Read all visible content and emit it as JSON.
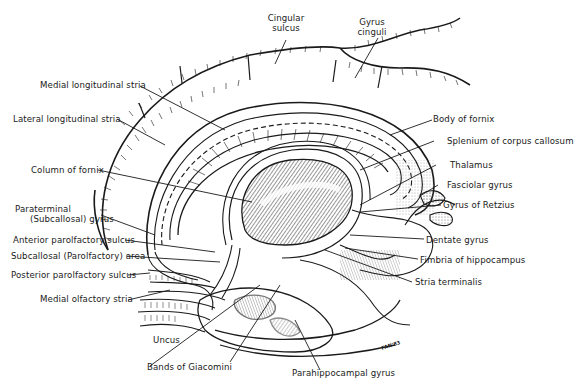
{
  "figure": {
    "signature": "FAN'83",
    "colors": {
      "ink": "#1a1a1a",
      "background": "#ffffff",
      "stipple": "#9a9a9a"
    }
  },
  "labels": {
    "cingular_sulcus": {
      "line1": "Cingular",
      "line2": "sulcus"
    },
    "gyrus_cinguli": {
      "line1": "Gyrus",
      "line2": "cinguli"
    },
    "medial_longitudinal_stria": "Medial longitudinal stria",
    "lateral_longitudinal_stria": "Lateral longitudinal stria",
    "column_of_fornix": "Column of fornix",
    "paraterminal_gyrus": {
      "line1": "Paraterminal",
      "line2": "(Subcallosal) gyrus"
    },
    "anterior_parolfactory_sulcus": "Anterior parolfactory sulcus",
    "subcallosal_area": "Subcallosal (Parolfactory) area",
    "posterior_parolfactory_sulcus": "Posterior parolfactory sulcus",
    "medial_olfactory_stria": "Medial olfactory stria",
    "uncus": "Uncus",
    "bands_of_giacomini": "Bands of Giacomini",
    "parahippocampal_gyrus": "Parahippocampal gyrus",
    "body_of_fornix": "Body of fornix",
    "splenium": "Splenium of corpus callosum",
    "thalamus": "Thalamus",
    "fasciolar_gyrus": "Fasciolar gyrus",
    "gyrus_of_retzius": "Gyrus of Retzius",
    "dentate_gyrus": "Dentate gyrus",
    "fimbria": "Fimbria of hippocampus",
    "stria_terminalis": "Stria terminalis"
  }
}
